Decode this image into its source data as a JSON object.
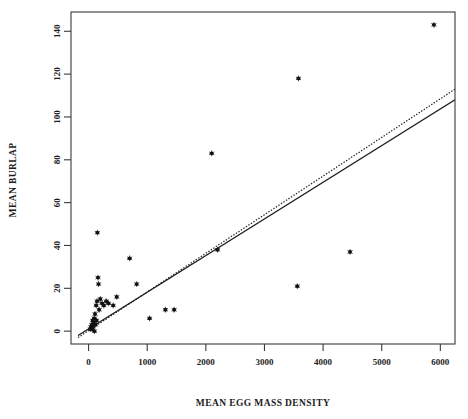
{
  "chart_data": {
    "type": "scatter",
    "title": "",
    "xlabel": "MEAN EGG MASS DENSITY",
    "ylabel": "MEAN BURLAP",
    "xlim": [
      -300,
      6250
    ],
    "ylim": [
      -6,
      149
    ],
    "xticks": [
      0,
      1000,
      2000,
      3000,
      4000,
      5000,
      6000
    ],
    "yticks": [
      0,
      20,
      40,
      60,
      80,
      100,
      120,
      140
    ],
    "xtick_labels": [
      "0",
      "1000",
      "2000",
      "3000",
      "4000",
      "5000",
      "6000"
    ],
    "ytick_labels": [
      "0",
      "20",
      "40",
      "60",
      "80",
      "100",
      "120",
      "140"
    ],
    "grid": false,
    "legend": "none",
    "marker": "asterisk-dot",
    "marker_color": "#111111",
    "points": [
      {
        "x": 30,
        "y": 1
      },
      {
        "x": 40,
        "y": 2
      },
      {
        "x": 55,
        "y": 3
      },
      {
        "x": 60,
        "y": 1
      },
      {
        "x": 70,
        "y": 5
      },
      {
        "x": 75,
        "y": 2
      },
      {
        "x": 85,
        "y": 4
      },
      {
        "x": 95,
        "y": 6
      },
      {
        "x": 100,
        "y": 0
      },
      {
        "x": 110,
        "y": 8
      },
      {
        "x": 120,
        "y": 3
      },
      {
        "x": 130,
        "y": 12
      },
      {
        "x": 135,
        "y": 5
      },
      {
        "x": 145,
        "y": 14
      },
      {
        "x": 150,
        "y": 46
      },
      {
        "x": 160,
        "y": 25
      },
      {
        "x": 170,
        "y": 22
      },
      {
        "x": 180,
        "y": 10
      },
      {
        "x": 200,
        "y": 15
      },
      {
        "x": 230,
        "y": 13
      },
      {
        "x": 260,
        "y": 12
      },
      {
        "x": 300,
        "y": 14
      },
      {
        "x": 340,
        "y": 13
      },
      {
        "x": 420,
        "y": 12
      },
      {
        "x": 480,
        "y": 16
      },
      {
        "x": 700,
        "y": 34
      },
      {
        "x": 820,
        "y": 22
      },
      {
        "x": 1040,
        "y": 6
      },
      {
        "x": 1310,
        "y": 10
      },
      {
        "x": 1460,
        "y": 10
      },
      {
        "x": 2100,
        "y": 83
      },
      {
        "x": 2200,
        "y": 38
      },
      {
        "x": 3560,
        "y": 21
      },
      {
        "x": 3580,
        "y": 118
      },
      {
        "x": 4460,
        "y": 37
      },
      {
        "x": 5890,
        "y": 143
      }
    ],
    "fit_lines": [
      {
        "name": "solid-regression-line",
        "style": "solid",
        "x1": -180,
        "y1": -2,
        "x2": 6250,
        "y2": 108
      },
      {
        "name": "dotted-regression-line",
        "style": "dotted",
        "x1": -180,
        "y1": -3,
        "x2": 6250,
        "y2": 113
      }
    ]
  }
}
